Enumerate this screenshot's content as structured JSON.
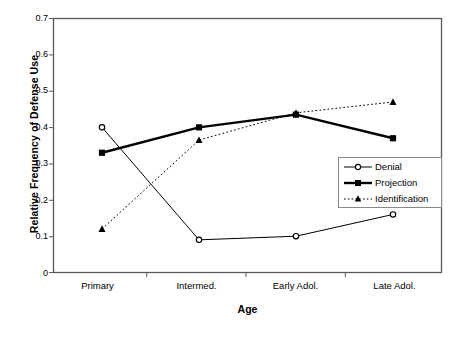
{
  "chart_data": {
    "type": "line",
    "title": "",
    "xlabel": "Age",
    "ylabel": "Relative Frequency of Defense Use",
    "categories": [
      "Primary",
      "Intermed.",
      "Early Adol.",
      "Late Adol."
    ],
    "ylim": [
      0,
      0.7
    ],
    "yticks": [
      "0",
      "0.1",
      "0.2",
      "0.3",
      "0.4",
      "0.5",
      "0.6",
      "0.7"
    ],
    "ytick_values": [
      0,
      0.1,
      0.2,
      0.3,
      0.4,
      0.5,
      0.6,
      0.7
    ],
    "grid": false,
    "legend_position": "center-right",
    "series": [
      {
        "name": "Denial",
        "values": [
          0.4,
          0.09,
          0.1,
          0.16
        ],
        "marker": "open-circle",
        "line_style": "solid",
        "line_width": 1,
        "color": "#000000"
      },
      {
        "name": "Projection",
        "values": [
          0.33,
          0.4,
          0.435,
          0.37
        ],
        "marker": "filled-square",
        "line_style": "solid",
        "line_width": 2.4,
        "color": "#000000"
      },
      {
        "name": "Identification",
        "values": [
          0.12,
          0.365,
          0.44,
          0.47
        ],
        "marker": "filled-triangle",
        "line_style": "dotted",
        "line_width": 1,
        "color": "#000000"
      }
    ]
  },
  "axis": {
    "y_title": "Relative Frequency of Defense Use",
    "x_title": "Age",
    "y_labels": [
      "0.7",
      "0.6",
      "0.5",
      "0.4",
      "0.3",
      "0.2",
      "0.1",
      "0"
    ],
    "x_labels": [
      "Primary",
      "Intermed.",
      "Early Adol.",
      "Late Adol."
    ]
  },
  "legend": {
    "items": [
      {
        "label": "Denial"
      },
      {
        "label": "Projection"
      },
      {
        "label": "Identification"
      }
    ]
  },
  "colors": {
    "plot_border": "#595959",
    "series": "#000000",
    "background": "#ffffff"
  }
}
